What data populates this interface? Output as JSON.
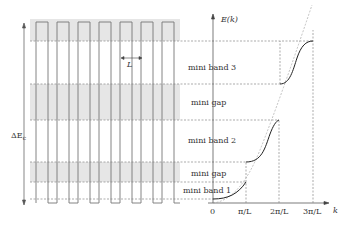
{
  "figure": {
    "left_panel": {
      "period_label": "L",
      "barrier_label": "ΔE",
      "barrier_subscript": "c",
      "wells_count": 7
    },
    "right_panel": {
      "y_axis_label": "E(k)",
      "x_axis_label": "k",
      "x_ticks": [
        "0",
        "π/L",
        "2π/L",
        "3π/L"
      ],
      "region_labels": [
        "mini band 3",
        "mini gap",
        "mini band 2",
        "mini gap",
        "mini band 1"
      ]
    },
    "colors": {
      "shade": "#e6e6e6",
      "line": "#777777",
      "curve": "#222222",
      "dash": "#888888"
    }
  }
}
